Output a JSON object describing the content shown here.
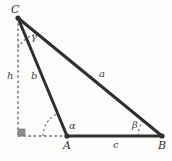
{
  "figure": {
    "kind": "triangle-with-altitude-diagram",
    "background_color": "#fdfdfb",
    "stroke_color": "#2f2f2f",
    "dash_color": "#6e6e6e",
    "right_angle_marker_color": "#8c8c8c",
    "vertices": [
      {
        "id": "C",
        "label": "C",
        "x": 18,
        "y": 18,
        "label_x": 11,
        "label_y": 4
      },
      {
        "id": "A",
        "label": "A",
        "x": 67,
        "y": 136,
        "label_x": 63,
        "label_y": 140
      },
      {
        "id": "B",
        "label": "B",
        "x": 162,
        "y": 136,
        "label_x": 158,
        "label_y": 140
      }
    ],
    "foot": {
      "id": "H",
      "x": 18,
      "y": 136
    },
    "sides": [
      {
        "id": "a",
        "label": "a",
        "from": "C",
        "to": "B",
        "label_x": 99,
        "label_y": 69
      },
      {
        "id": "b",
        "label": "b",
        "from": "C",
        "to": "A",
        "label_x": 31,
        "label_y": 71
      },
      {
        "id": "c",
        "label": "c",
        "from": "A",
        "to": "B",
        "label_x": 113,
        "label_y": 140
      },
      {
        "id": "h",
        "label": "h",
        "from": "C",
        "to": "H",
        "label_x": 7,
        "label_y": 71
      }
    ],
    "angles": [
      {
        "id": "alpha",
        "label": "α",
        "at": "A",
        "label_x": 69,
        "label_y": 121
      },
      {
        "id": "beta",
        "label": "β",
        "at": "B",
        "label_x": 132,
        "label_y": 120
      },
      {
        "id": "gamma",
        "label": "γ",
        "at": "C",
        "label_x": 31,
        "label_y": 32
      }
    ],
    "right_angle": {
      "at": "H",
      "label": "",
      "size": 7
    }
  }
}
